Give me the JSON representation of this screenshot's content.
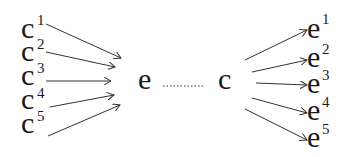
{
  "diagram": {
    "left_nodes": [
      {
        "base": "c",
        "sup": "1"
      },
      {
        "base": "c",
        "sup": "2"
      },
      {
        "base": "c",
        "sup": "3"
      },
      {
        "base": "c",
        "sup": "4"
      },
      {
        "base": "c",
        "sup": "5"
      }
    ],
    "center_left": {
      "label": "e"
    },
    "center_right": {
      "label": "c"
    },
    "connector": "dotted",
    "right_nodes": [
      {
        "base": "e",
        "sup": "1"
      },
      {
        "base": "e",
        "sup": "2"
      },
      {
        "base": "e",
        "sup": "3"
      },
      {
        "base": "e",
        "sup": "4"
      },
      {
        "base": "e",
        "sup": "5"
      }
    ],
    "colors": {
      "ink": "#1a1a1a",
      "background": "#ffffff"
    }
  }
}
